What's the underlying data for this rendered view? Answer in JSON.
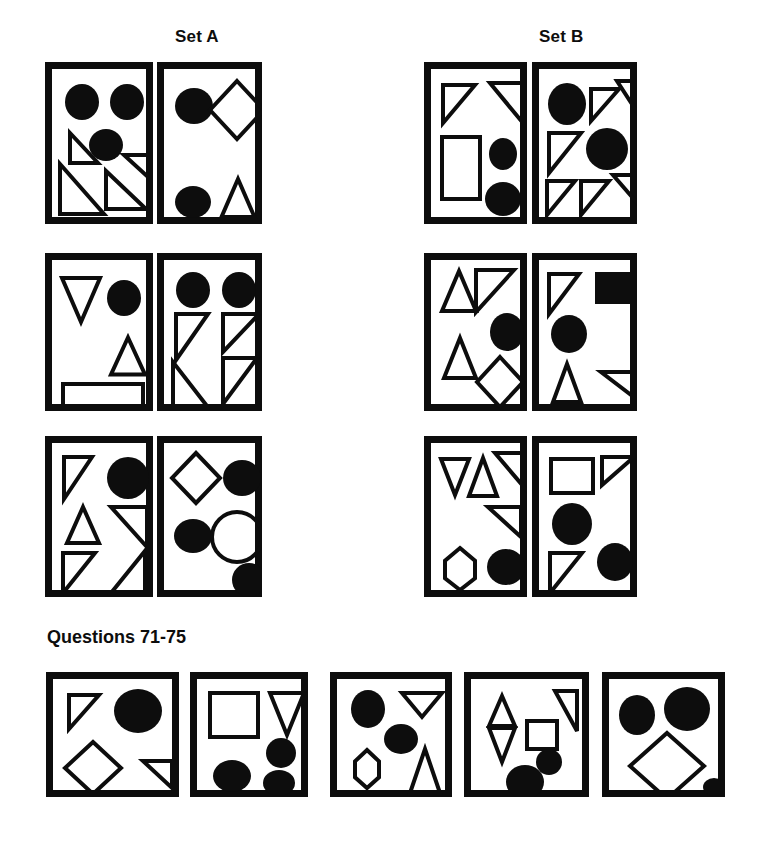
{
  "page": {
    "width": 766,
    "height": 842,
    "background": "#ffffff",
    "ink": "#0d0d0d",
    "stroke_width": 4,
    "frame_stroke_width": 7
  },
  "headings": {
    "set_a": "Set A",
    "set_b": "Set B",
    "questions": "Questions 71-75"
  },
  "legend": {
    "shape_kinds": [
      "circle",
      "ellipse",
      "triangle-up",
      "triangle-down",
      "right-triangle",
      "square",
      "rectangle",
      "diamond",
      "pentagon-down"
    ],
    "fills": [
      "solid",
      "outline"
    ]
  },
  "panels": [
    {
      "id": "set-a-r1-c1",
      "group": "Set A",
      "row": 1,
      "col": 1,
      "frame": {
        "x": 45,
        "y": 62,
        "w": 108,
        "h": 162
      },
      "shapes": [
        {
          "kind": "ellipse",
          "fill": "solid",
          "cx": 28,
          "cy": 31,
          "rx": 17,
          "ry": 18
        },
        {
          "kind": "ellipse",
          "fill": "solid",
          "cx": 73,
          "cy": 31,
          "rx": 17,
          "ry": 18
        },
        {
          "kind": "ellipse",
          "fill": "solid",
          "cx": 52,
          "cy": 74,
          "rx": 17,
          "ry": 16
        },
        {
          "kind": "right-triangle",
          "fill": "outline",
          "orient": "bl",
          "x": 16,
          "y": 62,
          "w": 28,
          "h": 30
        },
        {
          "kind": "right-triangle",
          "fill": "outline",
          "orient": "bl",
          "x": 6,
          "y": 93,
          "w": 44,
          "h": 50
        },
        {
          "kind": "right-triangle",
          "fill": "outline",
          "orient": "tr",
          "x": 70,
          "y": 84,
          "w": 24,
          "h": 22
        },
        {
          "kind": "right-triangle",
          "fill": "outline",
          "orient": "bl",
          "x": 52,
          "y": 100,
          "w": 40,
          "h": 38
        }
      ]
    },
    {
      "id": "set-a-r1-c2",
      "group": "Set A",
      "row": 1,
      "col": 2,
      "frame": {
        "x": 157,
        "y": 62,
        "w": 105,
        "h": 162
      },
      "shapes": [
        {
          "kind": "ellipse",
          "fill": "solid",
          "cx": 28,
          "cy": 35,
          "rx": 19,
          "ry": 18
        },
        {
          "kind": "diamond",
          "fill": "outline",
          "cx": 71,
          "cy": 39,
          "rx": 27,
          "ry": 29
        },
        {
          "kind": "ellipse",
          "fill": "solid",
          "cx": 27,
          "cy": 131,
          "rx": 18,
          "ry": 16
        },
        {
          "kind": "triangle-up",
          "fill": "outline",
          "cx": 72,
          "cy": 127,
          "w": 33,
          "h": 38
        }
      ]
    },
    {
      "id": "set-a-r2-c1",
      "group": "Set A",
      "row": 2,
      "col": 1,
      "frame": {
        "x": 45,
        "y": 253,
        "w": 108,
        "h": 158
      },
      "shapes": [
        {
          "kind": "triangle-down",
          "fill": "outline",
          "cx": 27,
          "cy": 38,
          "w": 38,
          "h": 44
        },
        {
          "kind": "ellipse",
          "fill": "solid",
          "cx": 70,
          "cy": 36,
          "rx": 17,
          "ry": 18
        },
        {
          "kind": "triangle-up",
          "fill": "outline",
          "cx": 74,
          "cy": 94,
          "w": 34,
          "h": 37
        },
        {
          "kind": "rectangle",
          "fill": "outline",
          "x": 9,
          "y": 122,
          "w": 80,
          "h": 22
        }
      ]
    },
    {
      "id": "set-a-r2-c2",
      "group": "Set A",
      "row": 2,
      "col": 2,
      "frame": {
        "x": 157,
        "y": 253,
        "w": 105,
        "h": 158
      },
      "shapes": [
        {
          "kind": "ellipse",
          "fill": "solid",
          "cx": 27,
          "cy": 28,
          "rx": 17,
          "ry": 18
        },
        {
          "kind": "ellipse",
          "fill": "solid",
          "cx": 73,
          "cy": 28,
          "rx": 17,
          "ry": 18
        },
        {
          "kind": "right-triangle",
          "fill": "outline",
          "orient": "tl",
          "x": 10,
          "y": 52,
          "w": 32,
          "h": 46
        },
        {
          "kind": "right-triangle",
          "fill": "outline",
          "orient": "bl",
          "x": 7,
          "y": 100,
          "w": 34,
          "h": 44
        },
        {
          "kind": "right-triangle",
          "fill": "outline",
          "orient": "tl",
          "x": 57,
          "y": 52,
          "w": 36,
          "h": 38
        },
        {
          "kind": "right-triangle",
          "fill": "outline",
          "orient": "tl",
          "x": 57,
          "y": 96,
          "w": 34,
          "h": 46
        }
      ]
    },
    {
      "id": "set-a-r3-c1",
      "group": "Set A",
      "row": 3,
      "col": 1,
      "frame": {
        "x": 45,
        "y": 436,
        "w": 108,
        "h": 161
      },
      "shapes": [
        {
          "kind": "right-triangle",
          "fill": "outline",
          "orient": "tl",
          "x": 10,
          "y": 12,
          "w": 28,
          "h": 42
        },
        {
          "kind": "ellipse",
          "fill": "solid",
          "cx": 74,
          "cy": 33,
          "rx": 21,
          "ry": 21
        },
        {
          "kind": "triangle-up",
          "fill": "outline",
          "cx": 29,
          "cy": 80,
          "w": 32,
          "h": 36
        },
        {
          "kind": "right-triangle",
          "fill": "outline",
          "orient": "tr",
          "x": 57,
          "y": 62,
          "w": 36,
          "h": 40
        },
        {
          "kind": "right-triangle",
          "fill": "outline",
          "orient": "tl",
          "x": 9,
          "y": 108,
          "w": 32,
          "h": 40
        },
        {
          "kind": "right-triangle",
          "fill": "outline",
          "orient": "br",
          "x": 57,
          "y": 106,
          "w": 34,
          "h": 42
        }
      ]
    },
    {
      "id": "set-a-r3-c2",
      "group": "Set A",
      "row": 3,
      "col": 2,
      "frame": {
        "x": 157,
        "y": 436,
        "w": 105,
        "h": 161
      },
      "shapes": [
        {
          "kind": "diamond",
          "fill": "outline",
          "cx": 30,
          "cy": 33,
          "rx": 24,
          "ry": 25
        },
        {
          "kind": "ellipse",
          "fill": "solid",
          "cx": 76,
          "cy": 33,
          "rx": 19,
          "ry": 18
        },
        {
          "kind": "ellipse",
          "fill": "solid",
          "cx": 27,
          "cy": 91,
          "rx": 19,
          "ry": 17
        },
        {
          "kind": "circle",
          "fill": "outline",
          "cx": 71,
          "cy": 92,
          "r": 25
        },
        {
          "kind": "ellipse",
          "fill": "solid",
          "cx": 83,
          "cy": 135,
          "rx": 17,
          "ry": 17
        }
      ]
    },
    {
      "id": "set-b-r1-c1",
      "group": "Set B",
      "row": 1,
      "col": 1,
      "frame": {
        "x": 424,
        "y": 62,
        "w": 103,
        "h": 162
      },
      "shapes": [
        {
          "kind": "right-triangle",
          "fill": "outline",
          "orient": "tl",
          "x": 10,
          "y": 14,
          "w": 32,
          "h": 38
        },
        {
          "kind": "right-triangle",
          "fill": "outline",
          "orient": "tr",
          "x": 57,
          "y": 12,
          "w": 33,
          "h": 40
        },
        {
          "kind": "rectangle",
          "fill": "outline",
          "x": 9,
          "y": 66,
          "w": 38,
          "h": 62
        },
        {
          "kind": "ellipse",
          "fill": "solid",
          "cx": 70,
          "cy": 83,
          "rx": 14,
          "ry": 16
        },
        {
          "kind": "ellipse",
          "fill": "solid",
          "cx": 70,
          "cy": 128,
          "rx": 18,
          "ry": 17
        }
      ]
    },
    {
      "id": "set-b-r1-c2",
      "group": "Set B",
      "row": 1,
      "col": 2,
      "frame": {
        "x": 532,
        "y": 62,
        "w": 105,
        "h": 162
      },
      "shapes": [
        {
          "kind": "ellipse",
          "fill": "solid",
          "cx": 26,
          "cy": 33,
          "rx": 19,
          "ry": 21
        },
        {
          "kind": "right-triangle",
          "fill": "outline",
          "orient": "tl",
          "x": 50,
          "y": 18,
          "w": 28,
          "h": 32
        },
        {
          "kind": "right-triangle",
          "fill": "outline",
          "orient": "tr",
          "x": 76,
          "y": 10,
          "w": 22,
          "h": 34
        },
        {
          "kind": "right-triangle",
          "fill": "outline",
          "orient": "tl",
          "x": 8,
          "y": 62,
          "w": 32,
          "h": 40
        },
        {
          "kind": "ellipse",
          "fill": "solid",
          "cx": 66,
          "cy": 78,
          "rx": 21,
          "ry": 21
        },
        {
          "kind": "right-triangle",
          "fill": "outline",
          "orient": "tl",
          "x": 6,
          "y": 110,
          "w": 28,
          "h": 34
        },
        {
          "kind": "right-triangle",
          "fill": "outline",
          "orient": "tl",
          "x": 40,
          "y": 110,
          "w": 28,
          "h": 34
        },
        {
          "kind": "right-triangle",
          "fill": "outline",
          "orient": "tr",
          "x": 72,
          "y": 104,
          "w": 26,
          "h": 30
        }
      ]
    },
    {
      "id": "set-b-r2-c1",
      "group": "Set B",
      "row": 2,
      "col": 1,
      "frame": {
        "x": 424,
        "y": 253,
        "w": 103,
        "h": 158
      },
      "shapes": [
        {
          "kind": "triangle-up",
          "fill": "outline",
          "cx": 26,
          "cy": 29,
          "w": 34,
          "h": 40
        },
        {
          "kind": "right-triangle",
          "fill": "outline",
          "orient": "tl",
          "x": 43,
          "y": 8,
          "w": 38,
          "h": 42
        },
        {
          "kind": "triangle-up",
          "fill": "outline",
          "cx": 27,
          "cy": 96,
          "w": 32,
          "h": 40
        },
        {
          "kind": "ellipse",
          "fill": "solid",
          "cx": 74,
          "cy": 70,
          "rx": 17,
          "ry": 19
        },
        {
          "kind": "diamond",
          "fill": "outline",
          "cx": 67,
          "cy": 120,
          "rx": 23,
          "ry": 25
        }
      ]
    },
    {
      "id": "set-b-r2-c2",
      "group": "Set B",
      "row": 2,
      "col": 2,
      "frame": {
        "x": 532,
        "y": 253,
        "w": 105,
        "h": 158
      },
      "shapes": [
        {
          "kind": "right-triangle",
          "fill": "outline",
          "orient": "tl",
          "x": 8,
          "y": 12,
          "w": 30,
          "h": 40
        },
        {
          "kind": "rectangle",
          "fill": "solid",
          "x": 54,
          "y": 10,
          "w": 42,
          "h": 32
        },
        {
          "kind": "ellipse",
          "fill": "solid",
          "cx": 28,
          "cy": 72,
          "rx": 18,
          "ry": 19
        },
        {
          "kind": "triangle-up",
          "fill": "outline",
          "cx": 26,
          "cy": 121,
          "w": 28,
          "h": 38
        },
        {
          "kind": "right-triangle",
          "fill": "outline",
          "orient": "tr",
          "x": 60,
          "y": 110,
          "w": 34,
          "h": 26
        }
      ]
    },
    {
      "id": "set-b-r3-c1",
      "group": "Set B",
      "row": 3,
      "col": 1,
      "frame": {
        "x": 424,
        "y": 436,
        "w": 103,
        "h": 161
      },
      "shapes": [
        {
          "kind": "triangle-down",
          "fill": "outline",
          "cx": 22,
          "cy": 32,
          "w": 28,
          "h": 36
        },
        {
          "kind": "triangle-up",
          "fill": "outline",
          "cx": 50,
          "cy": 32,
          "w": 28,
          "h": 38
        },
        {
          "kind": "right-triangle",
          "fill": "outline",
          "orient": "tr",
          "x": 62,
          "y": 8,
          "w": 34,
          "h": 40
        },
        {
          "kind": "right-triangle",
          "fill": "outline",
          "orient": "tr",
          "x": 55,
          "y": 62,
          "w": 33,
          "h": 30
        },
        {
          "kind": "pentagon-down",
          "fill": "outline",
          "cx": 27,
          "cy": 124,
          "w": 30,
          "h": 42
        },
        {
          "kind": "ellipse",
          "fill": "solid",
          "cx": 73,
          "cy": 122,
          "rx": 19,
          "ry": 18
        }
      ]
    },
    {
      "id": "set-b-r3-c2",
      "group": "Set B",
      "row": 3,
      "col": 2,
      "frame": {
        "x": 532,
        "y": 436,
        "w": 105,
        "h": 161
      },
      "shapes": [
        {
          "kind": "rectangle",
          "fill": "outline",
          "x": 10,
          "y": 14,
          "w": 42,
          "h": 34
        },
        {
          "kind": "right-triangle",
          "fill": "outline",
          "orient": "tl",
          "x": 61,
          "y": 12,
          "w": 32,
          "h": 28
        },
        {
          "kind": "ellipse",
          "fill": "solid",
          "cx": 31,
          "cy": 79,
          "rx": 20,
          "ry": 21
        },
        {
          "kind": "right-triangle",
          "fill": "outline",
          "orient": "tl",
          "x": 9,
          "y": 108,
          "w": 32,
          "h": 40
        },
        {
          "kind": "ellipse",
          "fill": "solid",
          "cx": 74,
          "cy": 117,
          "rx": 18,
          "ry": 19
        }
      ]
    },
    {
      "id": "question-71",
      "group": "Questions",
      "row": 4,
      "col": 1,
      "frame": {
        "x": 46,
        "y": 672,
        "w": 133,
        "h": 125
      },
      "shapes": [
        {
          "kind": "right-triangle",
          "fill": "outline",
          "orient": "tl",
          "x": 14,
          "y": 14,
          "w": 30,
          "h": 34
        },
        {
          "kind": "ellipse",
          "fill": "solid",
          "cx": 83,
          "cy": 30,
          "rx": 24,
          "ry": 22
        },
        {
          "kind": "diamond",
          "fill": "outline",
          "cx": 38,
          "cy": 87,
          "rx": 28,
          "ry": 26
        },
        {
          "kind": "right-triangle",
          "fill": "outline",
          "orient": "tr",
          "x": 88,
          "y": 80,
          "w": 29,
          "h": 27
        }
      ]
    },
    {
      "id": "question-72",
      "group": "Questions",
      "row": 4,
      "col": 2,
      "frame": {
        "x": 190,
        "y": 672,
        "w": 118,
        "h": 125
      },
      "shapes": [
        {
          "kind": "rectangle",
          "fill": "outline",
          "x": 11,
          "y": 12,
          "w": 48,
          "h": 44
        },
        {
          "kind": "triangle-down",
          "fill": "outline",
          "cx": 88,
          "cy": 33,
          "w": 34,
          "h": 42
        },
        {
          "kind": "ellipse",
          "fill": "solid",
          "cx": 82,
          "cy": 72,
          "rx": 15,
          "ry": 15
        },
        {
          "kind": "ellipse",
          "fill": "solid",
          "cx": 33,
          "cy": 95,
          "rx": 19,
          "ry": 16
        },
        {
          "kind": "ellipse",
          "fill": "solid",
          "cx": 80,
          "cy": 102,
          "rx": 16,
          "ry": 13
        }
      ]
    },
    {
      "id": "question-73",
      "group": "Questions",
      "row": 4,
      "col": 3,
      "frame": {
        "x": 330,
        "y": 672,
        "w": 122,
        "h": 125
      },
      "shapes": [
        {
          "kind": "ellipse",
          "fill": "solid",
          "cx": 29,
          "cy": 28,
          "rx": 17,
          "ry": 19
        },
        {
          "kind": "triangle-down",
          "fill": "outline",
          "cx": 83,
          "cy": 24,
          "w": 40,
          "h": 24
        },
        {
          "kind": "ellipse",
          "fill": "solid",
          "cx": 62,
          "cy": 58,
          "rx": 17,
          "ry": 15
        },
        {
          "kind": "pentagon-down",
          "fill": "outline",
          "cx": 28,
          "cy": 88,
          "w": 24,
          "h": 38
        },
        {
          "kind": "triangle-up",
          "fill": "outline",
          "cx": 86,
          "cy": 90,
          "w": 30,
          "h": 44
        }
      ]
    },
    {
      "id": "question-74",
      "group": "Questions",
      "row": 4,
      "col": 4,
      "frame": {
        "x": 464,
        "y": 672,
        "w": 125,
        "h": 125
      },
      "shapes": [
        {
          "kind": "triangle-up",
          "fill": "outline",
          "cx": 29,
          "cy": 30,
          "w": 26,
          "h": 30
        },
        {
          "kind": "triangle-down",
          "fill": "outline",
          "cx": 29,
          "cy": 64,
          "w": 26,
          "h": 34
        },
        {
          "kind": "right-triangle",
          "fill": "outline",
          "orient": "tr",
          "x": 82,
          "y": 10,
          "w": 22,
          "h": 40
        },
        {
          "kind": "rectangle",
          "fill": "outline",
          "x": 54,
          "y": 40,
          "w": 30,
          "h": 28
        },
        {
          "kind": "ellipse",
          "fill": "solid",
          "cx": 76,
          "cy": 81,
          "rx": 13,
          "ry": 13
        },
        {
          "kind": "ellipse",
          "fill": "solid",
          "cx": 52,
          "cy": 101,
          "rx": 19,
          "ry": 17
        }
      ]
    },
    {
      "id": "question-75",
      "group": "Questions",
      "row": 4,
      "col": 5,
      "frame": {
        "x": 602,
        "y": 672,
        "w": 123,
        "h": 125
      },
      "shapes": [
        {
          "kind": "ellipse",
          "fill": "solid",
          "cx": 26,
          "cy": 34,
          "rx": 18,
          "ry": 20
        },
        {
          "kind": "ellipse",
          "fill": "solid",
          "cx": 76,
          "cy": 28,
          "rx": 23,
          "ry": 22
        },
        {
          "kind": "diamond",
          "fill": "outline",
          "cx": 56,
          "cy": 85,
          "rx": 37,
          "ry": 33
        },
        {
          "kind": "ellipse",
          "fill": "solid",
          "cx": 103,
          "cy": 106,
          "rx": 11,
          "ry": 9
        }
      ]
    }
  ]
}
